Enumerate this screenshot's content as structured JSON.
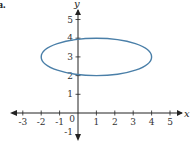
{
  "figure": {
    "part_label": "a.",
    "ellipse_color": "#4a7fa8",
    "axis_color": "#222222"
  },
  "chart_data": {
    "type": "line",
    "title": "",
    "xlabel": "x",
    "ylabel": "y",
    "xlim": [
      -3.5,
      5.5
    ],
    "ylim": [
      -1.5,
      5.8
    ],
    "x_ticks": [
      -3,
      -2,
      -1,
      0,
      1,
      2,
      3,
      4,
      5
    ],
    "y_ticks": [
      -1,
      1,
      2,
      3,
      4,
      5
    ],
    "x_tick_labels": [
      "-3",
      "-2",
      "-1",
      "0",
      "1",
      "2",
      "3",
      "4",
      "5"
    ],
    "y_tick_labels": [
      "-1",
      "1",
      "2",
      "3",
      "4",
      "5"
    ],
    "grid": false,
    "series": [
      {
        "name": "ellipse",
        "shape": "ellipse",
        "center": [
          1,
          3
        ],
        "semi_axis_x": 3,
        "semi_axis_y": 1,
        "equation": "(x-1)^2/9 + (y-3)^2/1 = 1",
        "x_range": [
          -2,
          4
        ],
        "y_range": [
          2,
          4
        ],
        "color": "#4a7fa8"
      }
    ]
  }
}
